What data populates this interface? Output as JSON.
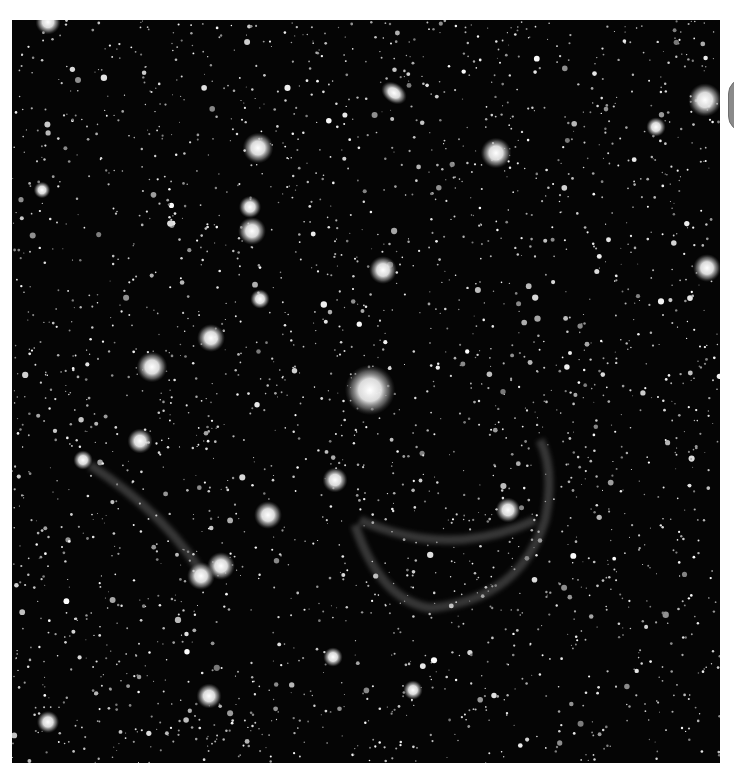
{
  "image": {
    "subject": "star field with faint nebula shell",
    "colors": {
      "background": "#ffffff",
      "sky": "#050505",
      "star": "#ffffff",
      "nebula": "#9a9a9a",
      "control": "#8a8a8a"
    }
  },
  "bright_stars": [
    {
      "x": 370,
      "y": 390,
      "r": 18
    },
    {
      "x": 258,
      "y": 148,
      "r": 11
    },
    {
      "x": 496,
      "y": 153,
      "r": 11
    },
    {
      "x": 383,
      "y": 270,
      "r": 10
    },
    {
      "x": 211,
      "y": 338,
      "r": 10
    },
    {
      "x": 152,
      "y": 367,
      "r": 11
    },
    {
      "x": 252,
      "y": 231,
      "r": 10
    },
    {
      "x": 250,
      "y": 207,
      "r": 8
    },
    {
      "x": 140,
      "y": 441,
      "r": 9
    },
    {
      "x": 268,
      "y": 515,
      "r": 10
    },
    {
      "x": 335,
      "y": 480,
      "r": 9
    },
    {
      "x": 508,
      "y": 510,
      "r": 9
    },
    {
      "x": 221,
      "y": 566,
      "r": 10
    },
    {
      "x": 201,
      "y": 576,
      "r": 10
    },
    {
      "x": 705,
      "y": 100,
      "r": 12
    },
    {
      "x": 707,
      "y": 268,
      "r": 10
    },
    {
      "x": 48,
      "y": 722,
      "r": 8
    },
    {
      "x": 209,
      "y": 696,
      "r": 9
    },
    {
      "x": 48,
      "y": 22,
      "r": 9
    },
    {
      "x": 260,
      "y": 299,
      "r": 7
    },
    {
      "x": 333,
      "y": 657,
      "r": 7
    },
    {
      "x": 413,
      "y": 690,
      "r": 7
    },
    {
      "x": 656,
      "y": 127,
      "r": 7
    },
    {
      "x": 42,
      "y": 190,
      "r": 6
    },
    {
      "x": 83,
      "y": 460,
      "r": 7
    }
  ],
  "galaxy": {
    "x": 394,
    "y": 93,
    "rx": 14,
    "ry": 10,
    "rotate": 35
  },
  "nebula_arcs": [
    "M 90 465 Q 160 510 200 570",
    "M 355 525 Q 380 600 430 608 Q 520 600 545 520 Q 555 470 540 440",
    "M 360 520 Q 450 560 535 520"
  ],
  "side_control": {
    "icon": "scroll-handle-icon"
  }
}
